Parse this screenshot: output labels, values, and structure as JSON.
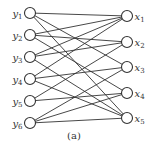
{
  "diagram": {
    "type": "bipartite-graph",
    "caption": "(a)",
    "left_nodes": [
      {
        "id": "y1",
        "base": "y",
        "sub": "1",
        "cx": 30,
        "cy": 13
      },
      {
        "id": "y2",
        "base": "y",
        "sub": "2",
        "cx": 30,
        "cy": 35
      },
      {
        "id": "y3",
        "base": "y",
        "sub": "3",
        "cx": 30,
        "cy": 57
      },
      {
        "id": "y4",
        "base": "y",
        "sub": "4",
        "cx": 30,
        "cy": 79
      },
      {
        "id": "y5",
        "base": "y",
        "sub": "5",
        "cx": 30,
        "cy": 101
      },
      {
        "id": "y6",
        "base": "y",
        "sub": "6",
        "cx": 30,
        "cy": 123
      }
    ],
    "right_nodes": [
      {
        "id": "x1",
        "base": "x",
        "sub": "1",
        "cx": 127,
        "cy": 16
      },
      {
        "id": "x2",
        "base": "x",
        "sub": "2",
        "cx": 127,
        "cy": 42
      },
      {
        "id": "x3",
        "base": "x",
        "sub": "3",
        "cx": 127,
        "cy": 67
      },
      {
        "id": "x4",
        "base": "x",
        "sub": "4",
        "cx": 127,
        "cy": 93
      },
      {
        "id": "x5",
        "base": "x",
        "sub": "5",
        "cx": 127,
        "cy": 118
      }
    ],
    "edges": [
      [
        "y1",
        "x1"
      ],
      [
        "y1",
        "x3"
      ],
      [
        "y1",
        "x5"
      ],
      [
        "y2",
        "x1"
      ],
      [
        "y2",
        "x2"
      ],
      [
        "y2",
        "x4"
      ],
      [
        "y3",
        "x1"
      ],
      [
        "y3",
        "x2"
      ],
      [
        "y3",
        "x5"
      ],
      [
        "y4",
        "x1"
      ],
      [
        "y4",
        "x3"
      ],
      [
        "y4",
        "x5"
      ],
      [
        "y5",
        "x2"
      ],
      [
        "y5",
        "x4"
      ],
      [
        "y6",
        "x3"
      ],
      [
        "y6",
        "x4"
      ],
      [
        "y6",
        "x5"
      ]
    ],
    "node_radius": 5.5,
    "stroke_color": "#333333",
    "background": "#ffffff"
  }
}
